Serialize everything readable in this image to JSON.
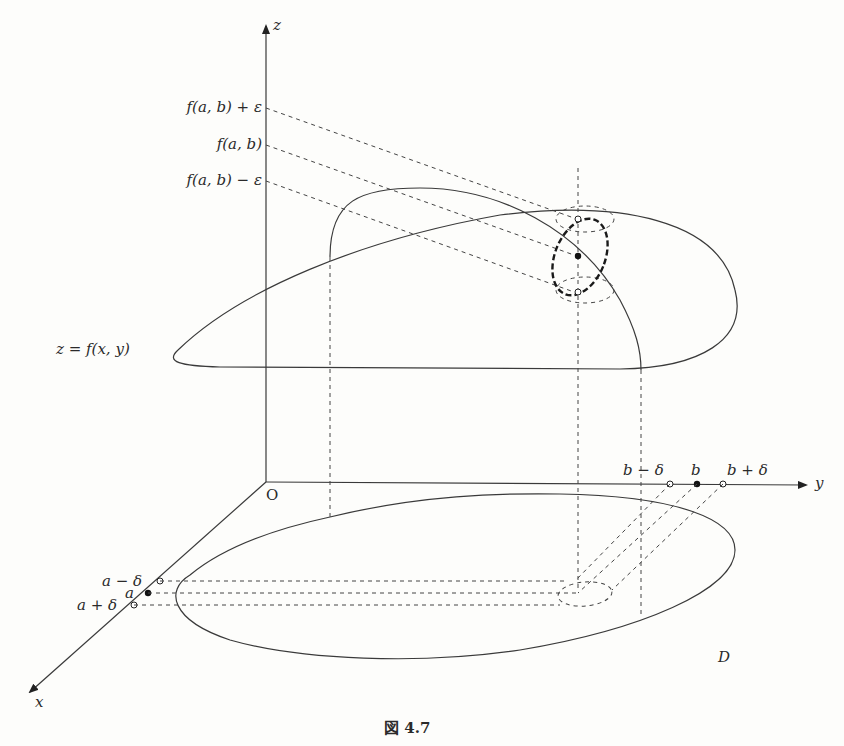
{
  "figure": {
    "caption": "図 4.7",
    "axes": {
      "x_label": "x",
      "y_label": "y",
      "z_label": "z",
      "origin_label": "O"
    },
    "z_ticks": [
      {
        "label": "f(a, b) + ε",
        "y": 108
      },
      {
        "label": "f(a, b)",
        "y": 145
      },
      {
        "label": "f(a, b) − ε",
        "y": 181
      }
    ],
    "y_ticks": [
      {
        "label": "b − δ",
        "kind": "open"
      },
      {
        "label": "b",
        "kind": "filled"
      },
      {
        "label": "b + δ",
        "kind": "open"
      }
    ],
    "x_ticks": [
      {
        "label": "a − δ",
        "kind": "open"
      },
      {
        "label": "a",
        "kind": "filled"
      },
      {
        "label": "a + δ",
        "kind": "open"
      }
    ],
    "surface_label": "z = f(x, y)",
    "domain_label": "D"
  }
}
